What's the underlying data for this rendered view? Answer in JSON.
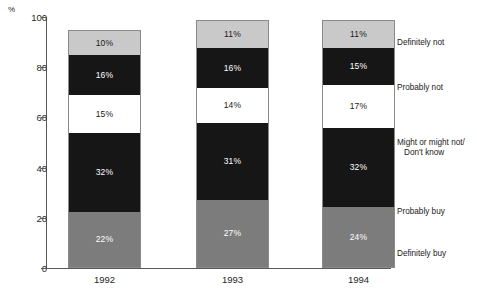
{
  "chart_data": {
    "type": "bar",
    "title": "",
    "subtitle": "",
    "xlabel": "",
    "ylabel": "%",
    "ylim": [
      0,
      100
    ],
    "grid": false,
    "stacked": true,
    "legend_position": "right",
    "categories": [
      "1992",
      "1993",
      "1994"
    ],
    "ytick_labels": [
      "0",
      "20",
      "40",
      "60",
      "80",
      "100"
    ],
    "ytick_values": [
      0,
      20,
      40,
      60,
      80,
      100
    ],
    "series": [
      {
        "name": "Definitely buy",
        "color": "#7c7c7c",
        "values": [
          22,
          27,
          24
        ],
        "labels": [
          "22%",
          "27%",
          "24%"
        ]
      },
      {
        "name": "Probably buy",
        "color": "#161616",
        "values": [
          32,
          31,
          32
        ],
        "labels": [
          "32%",
          "31%",
          "32%"
        ]
      },
      {
        "name": "Might or might not/Don't know",
        "color": "#ffffff",
        "values": [
          15,
          14,
          17
        ],
        "labels": [
          "15%",
          "14%",
          "17%"
        ]
      },
      {
        "name": "Probably not",
        "color": "#161616",
        "values": [
          16,
          16,
          15
        ],
        "labels": [
          "16%",
          "16%",
          "15%"
        ]
      },
      {
        "name": "Definitely not",
        "color": "#c9c9c9",
        "values": [
          10,
          11,
          11
        ],
        "labels": [
          "10%",
          "11%",
          "11%"
        ]
      }
    ]
  },
  "axis": {
    "percent_symbol": "%",
    "ticks": [
      {
        "label": "100",
        "value": 100
      },
      {
        "label": "80",
        "value": 80
      },
      {
        "label": "60",
        "value": 60
      },
      {
        "label": "40",
        "value": 40
      },
      {
        "label": "20",
        "value": 20
      },
      {
        "label": "0",
        "value": 0
      }
    ]
  },
  "bars": [
    {
      "year": "1992",
      "segments": [
        {
          "key": "defnot",
          "label": "10%",
          "value": 10
        },
        {
          "key": "probnot",
          "label": "16%",
          "value": 16
        },
        {
          "key": "might",
          "label": "15%",
          "value": 15
        },
        {
          "key": "probbuy",
          "label": "32%",
          "value": 32
        },
        {
          "key": "defbuy",
          "label": "22%",
          "value": 22
        }
      ]
    },
    {
      "year": "1993",
      "segments": [
        {
          "key": "defnot",
          "label": "11%",
          "value": 11
        },
        {
          "key": "probnot",
          "label": "16%",
          "value": 16
        },
        {
          "key": "might",
          "label": "14%",
          "value": 14
        },
        {
          "key": "probbuy",
          "label": "31%",
          "value": 31
        },
        {
          "key": "defbuy",
          "label": "27%",
          "value": 27
        }
      ]
    },
    {
      "year": "1994",
      "segments": [
        {
          "key": "defnot",
          "label": "11%",
          "value": 11
        },
        {
          "key": "probnot",
          "label": "15%",
          "value": 15
        },
        {
          "key": "might",
          "label": "17%",
          "value": 17
        },
        {
          "key": "probbuy",
          "label": "32%",
          "value": 32
        },
        {
          "key": "defbuy",
          "label": "24%",
          "value": 24
        }
      ]
    }
  ],
  "legend": {
    "items": [
      {
        "line1": "Definitely not",
        "line2": ""
      },
      {
        "line1": "Probably not",
        "line2": ""
      },
      {
        "line1": "Might or might not/",
        "line2": "Don't know"
      },
      {
        "line1": "Probably buy",
        "line2": ""
      },
      {
        "line1": "Definitely buy",
        "line2": ""
      }
    ]
  }
}
